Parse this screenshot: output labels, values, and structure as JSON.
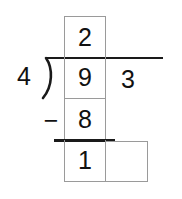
{
  "long_division": {
    "divisor": "4",
    "dividend_digits": [
      "9",
      "3"
    ],
    "quotient_digits": [
      "2",
      ""
    ],
    "steps": [
      {
        "operator": "−",
        "subtrahend": "8",
        "remainder_digits": [
          "1",
          ""
        ]
      }
    ]
  },
  "colors": {
    "ink": "#111111",
    "box_border": "#9a9a9a",
    "rule": "#1a1a1a",
    "background": "#ffffff"
  }
}
